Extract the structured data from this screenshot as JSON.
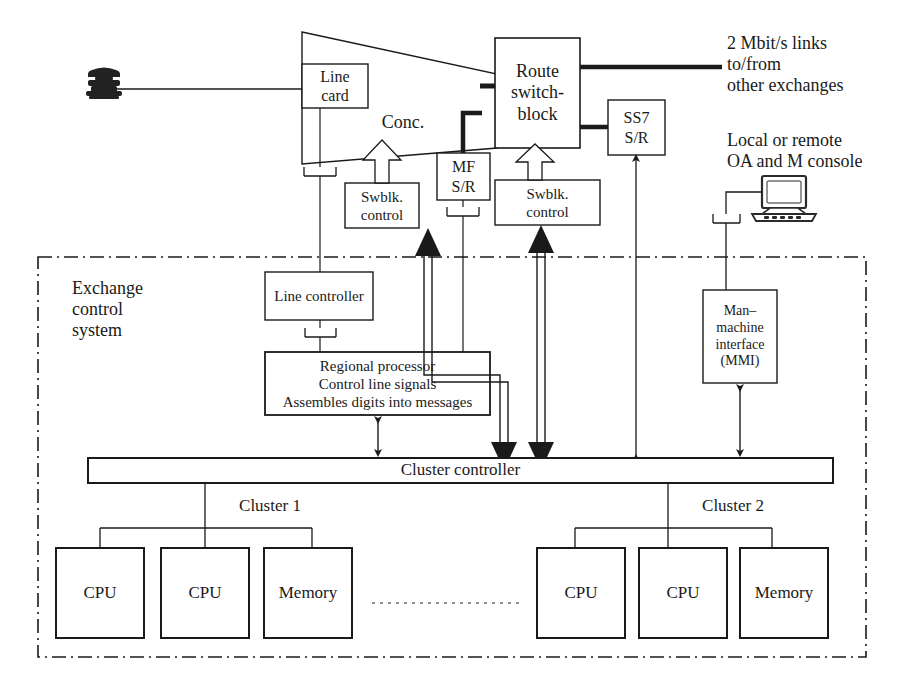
{
  "diagram": {
    "boundary_label": "Exchange\ncontrol\nsystem",
    "colors": {
      "line": "#1a1a1a",
      "fill": "#ffffff",
      "text": "#1a1a1a"
    }
  },
  "nodes": {
    "telephone": {
      "label": "",
      "icon": "telephone-icon"
    },
    "line_card": {
      "label": "Line\ncard"
    },
    "concentrator": {
      "label": "Conc."
    },
    "mf_sr": {
      "label": "MF\nS/R"
    },
    "route_switch_block": {
      "label": "Route\nswitch-\nblock"
    },
    "ss7_sr": {
      "label": "SS7\nS/R"
    },
    "swblk_control_left": {
      "label": "Swblk.\ncontrol"
    },
    "swblk_control_right": {
      "label": "Swblk.\ncontrol"
    },
    "line_controller": {
      "label": "Line controller"
    },
    "regional_processor": {
      "label": "Regional processor\nControl line signals\nAssembles digits into messages"
    },
    "mmi": {
      "label": "Man–\nmachine\ninterface\n(MMI)"
    },
    "console": {
      "label": "",
      "icon": "computer-monitor-icon"
    },
    "cluster_controller": {
      "label": "Cluster controller"
    },
    "cluster1_label": {
      "label": "Cluster 1"
    },
    "cluster2_label": {
      "label": "Cluster 2"
    },
    "cluster1": {
      "units": [
        {
          "label": "CPU"
        },
        {
          "label": "CPU"
        },
        {
          "label": "Memory"
        }
      ]
    },
    "cluster2": {
      "units": [
        {
          "label": "CPU"
        },
        {
          "label": "CPU"
        },
        {
          "label": "Memory"
        }
      ]
    }
  },
  "annotations": {
    "links_2mbit": "2 Mbit/s links\nto/from\nother exchanges",
    "oam_console": "Local or remote\nOA and M console"
  }
}
